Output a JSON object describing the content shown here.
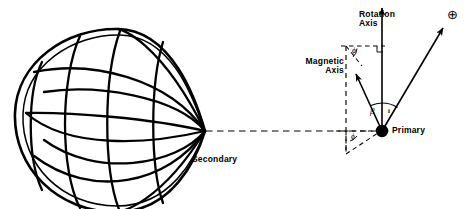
{
  "figure": {
    "background_color": "#ffffff",
    "stroke_color": "#000000",
    "width": 468,
    "height": 209
  },
  "labels": {
    "secondary": "Secondary",
    "primary": "Primary",
    "rotation_axis_line1": "Rotation",
    "rotation_axis_line2": "Axis",
    "magnetic_axis_line1": "Magnetic",
    "magnetic_axis_line2": "Axis"
  },
  "angles": {
    "beta": "β",
    "inclination": "i",
    "phi_upper": "ϕ",
    "phi_lower": "ϕ"
  },
  "symbols": {
    "observer": "⊕"
  },
  "elements": {
    "secondary_body": "roche-lobe-teardrop-mesh",
    "primary_body": "filled-dot",
    "orbital_axis": "horizontal-dashed-line",
    "reference_axis": "vertical-dashed-line",
    "rotation_axis_arrow": "solid-arrow-up",
    "magnetic_axis_arrow": "solid-arrow-up-left",
    "line_of_sight_arrow": "solid-arrow-up-right"
  }
}
